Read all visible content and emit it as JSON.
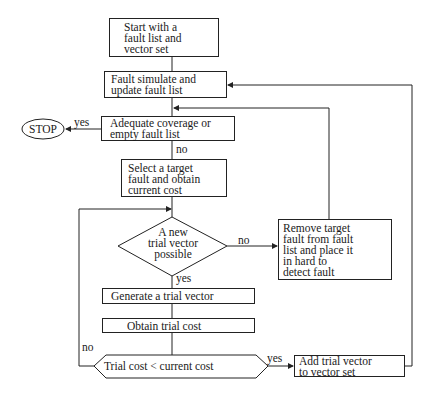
{
  "diagram": {
    "type": "flowchart",
    "nodes": {
      "start": {
        "text": "Start with a\nfault list and\nvector set",
        "shape": "rect"
      },
      "simulate": {
        "text": "Fault simulate and\nupdate fault list",
        "shape": "rect"
      },
      "adequate": {
        "text": "Adequate coverage or\nempty fault list",
        "shape": "rect-decision"
      },
      "stop": {
        "text": "STOP",
        "shape": "ellipse"
      },
      "select": {
        "text": "Select a target\nfault and obtain\ncurrent cost",
        "shape": "rect"
      },
      "new_trial": {
        "text": "A new\ntrial vector\npossible",
        "shape": "diamond"
      },
      "remove": {
        "text": "Remove target\nfault from fault\nlist and place it\nin hard to\ndetect fault",
        "shape": "rect"
      },
      "generate": {
        "text": "Generate a trial vector",
        "shape": "rect"
      },
      "obtain": {
        "text": "Obtain trial cost",
        "shape": "rect"
      },
      "compare": {
        "text": "Trial cost < current cost",
        "shape": "hexagon"
      },
      "add": {
        "text": "Add trial vector\nto vector set",
        "shape": "rect"
      }
    },
    "edge_labels": {
      "adequate_yes": "yes",
      "adequate_no": "no",
      "new_trial_no": "no",
      "new_trial_yes": "yes",
      "compare_no": "no",
      "compare_yes": "yes"
    },
    "edges": [
      {
        "from": "start",
        "to": "simulate"
      },
      {
        "from": "simulate",
        "to": "adequate"
      },
      {
        "from": "adequate",
        "to": "stop",
        "label": "yes"
      },
      {
        "from": "adequate",
        "to": "select",
        "label": "no"
      },
      {
        "from": "select",
        "to": "new_trial"
      },
      {
        "from": "new_trial",
        "to": "remove",
        "label": "no"
      },
      {
        "from": "remove",
        "to": "adequate"
      },
      {
        "from": "new_trial",
        "to": "generate",
        "label": "yes"
      },
      {
        "from": "generate",
        "to": "obtain"
      },
      {
        "from": "obtain",
        "to": "compare"
      },
      {
        "from": "compare",
        "to": "new_trial",
        "label": "no"
      },
      {
        "from": "compare",
        "to": "add",
        "label": "yes"
      },
      {
        "from": "add",
        "to": "simulate"
      }
    ]
  }
}
